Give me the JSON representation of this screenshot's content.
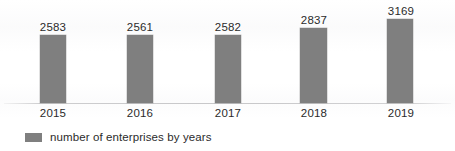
{
  "chart_data": {
    "type": "bar",
    "title": "",
    "subtitle": "",
    "xlabel": "",
    "ylabel": "",
    "categories": [
      "2015",
      "2016",
      "2017",
      "2018",
      "2019"
    ],
    "values": [
      2583,
      2561,
      2582,
      2837,
      3169
    ],
    "value_labels": [
      "2583",
      "2561",
      "2582",
      "2837",
      "3169"
    ],
    "series": [
      {
        "name": "number of enterprises by years",
        "values": [
          2583,
          2561,
          2582,
          2837,
          3169
        ],
        "color": "#7f7f7f"
      }
    ],
    "legend": {
      "position": "bottom-left",
      "entries": [
        {
          "label": "number of enterprises by years",
          "color": "#7f7f7f"
        }
      ]
    },
    "axis": {
      "x_tick_labels": [
        "2015",
        "2016",
        "2017",
        "2018",
        "2019"
      ],
      "y_tick_labels": [],
      "ylim": [
        0,
        3600
      ],
      "y_axis_visible": false,
      "x_axis_visible": true,
      "grid": false
    },
    "data_labels_shown": true,
    "background_color": "#ffffff",
    "label_color": "#2b2b2b"
  }
}
